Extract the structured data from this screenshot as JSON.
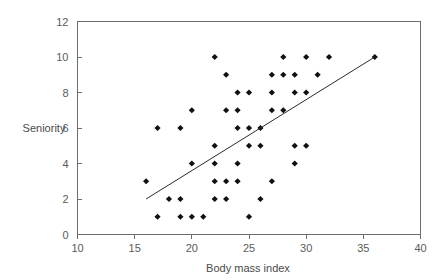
{
  "chart_data": {
    "type": "scatter",
    "title": "",
    "xlabel": "Body mass index",
    "ylabel": "Seniority",
    "xlim": [
      10,
      40
    ],
    "ylim": [
      0,
      12
    ],
    "xticks": [
      10,
      15,
      20,
      25,
      30,
      35,
      40
    ],
    "yticks": [
      0,
      2,
      4,
      6,
      8,
      10,
      12
    ],
    "grid": false,
    "legend": null,
    "points": [
      {
        "x": 16,
        "y": 3
      },
      {
        "x": 17,
        "y": 1
      },
      {
        "x": 17,
        "y": 6
      },
      {
        "x": 18,
        "y": 2
      },
      {
        "x": 19,
        "y": 1
      },
      {
        "x": 19,
        "y": 2
      },
      {
        "x": 19,
        "y": 6
      },
      {
        "x": 20,
        "y": 1
      },
      {
        "x": 20,
        "y": 4
      },
      {
        "x": 20,
        "y": 7
      },
      {
        "x": 21,
        "y": 1
      },
      {
        "x": 22,
        "y": 2
      },
      {
        "x": 22,
        "y": 3
      },
      {
        "x": 22,
        "y": 4
      },
      {
        "x": 22,
        "y": 5
      },
      {
        "x": 22,
        "y": 10
      },
      {
        "x": 23,
        "y": 2
      },
      {
        "x": 23,
        "y": 3
      },
      {
        "x": 23,
        "y": 7
      },
      {
        "x": 23,
        "y": 9
      },
      {
        "x": 24,
        "y": 3
      },
      {
        "x": 24,
        "y": 4
      },
      {
        "x": 24,
        "y": 6
      },
      {
        "x": 24,
        "y": 7
      },
      {
        "x": 24,
        "y": 8
      },
      {
        "x": 25,
        "y": 1
      },
      {
        "x": 25,
        "y": 5
      },
      {
        "x": 25,
        "y": 6
      },
      {
        "x": 25,
        "y": 8
      },
      {
        "x": 26,
        "y": 2
      },
      {
        "x": 26,
        "y": 5
      },
      {
        "x": 26,
        "y": 6
      },
      {
        "x": 27,
        "y": 3
      },
      {
        "x": 27,
        "y": 7
      },
      {
        "x": 27,
        "y": 8
      },
      {
        "x": 27,
        "y": 9
      },
      {
        "x": 28,
        "y": 7
      },
      {
        "x": 28,
        "y": 9
      },
      {
        "x": 28,
        "y": 10
      },
      {
        "x": 29,
        "y": 4
      },
      {
        "x": 29,
        "y": 5
      },
      {
        "x": 29,
        "y": 8
      },
      {
        "x": 29,
        "y": 9
      },
      {
        "x": 30,
        "y": 5
      },
      {
        "x": 30,
        "y": 8
      },
      {
        "x": 30,
        "y": 10
      },
      {
        "x": 31,
        "y": 9
      },
      {
        "x": 32,
        "y": 10
      },
      {
        "x": 36,
        "y": 10
      }
    ],
    "fit_line": {
      "name": "regression-line",
      "x_start": 16,
      "y_start": 2,
      "x_end": 36,
      "y_end": 10
    }
  },
  "colors": {
    "point": "#111111",
    "line": "#2b2b2b",
    "axis": "#6d6d6d",
    "label": "#5a5a5a",
    "background": "#ffffff"
  }
}
